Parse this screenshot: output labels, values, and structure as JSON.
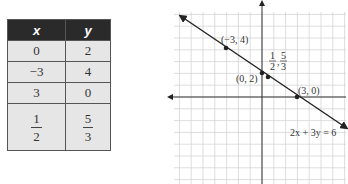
{
  "table": {
    "headers": [
      "x",
      "y"
    ],
    "rows": [
      {
        "x": "0",
        "y": "2"
      },
      {
        "x": "−3",
        "y": "4"
      },
      {
        "x": "3",
        "y": "0"
      },
      {
        "x_num": "1",
        "x_den": "2",
        "y_num": "5",
        "y_den": "3"
      }
    ]
  },
  "graph": {
    "equation": "2x + 3y = 6",
    "points": [
      {
        "label": "(−3, 4)",
        "x": -3,
        "y": 4
      },
      {
        "label": "(0, 2)",
        "x": 0,
        "y": 2
      },
      {
        "label_num1": "1",
        "label_den1": "2",
        "label_num2": "5",
        "label_den2": "3",
        "x": 0.5,
        "y": 1.6667
      },
      {
        "label": "(3, 0)",
        "x": 3,
        "y": 0
      }
    ]
  },
  "chart_data": {
    "type": "line",
    "title": "",
    "equation": "2x + 3y = 6",
    "series": [
      {
        "name": "2x + 3y = 6",
        "x": [
          -3,
          0,
          0.5,
          3
        ],
        "y": [
          4,
          2,
          1.667,
          0
        ]
      }
    ],
    "xlabel": "",
    "ylabel": "",
    "grid": true,
    "xlim": [
      -8,
      7
    ],
    "ylim": [
      -7,
      8
    ]
  }
}
